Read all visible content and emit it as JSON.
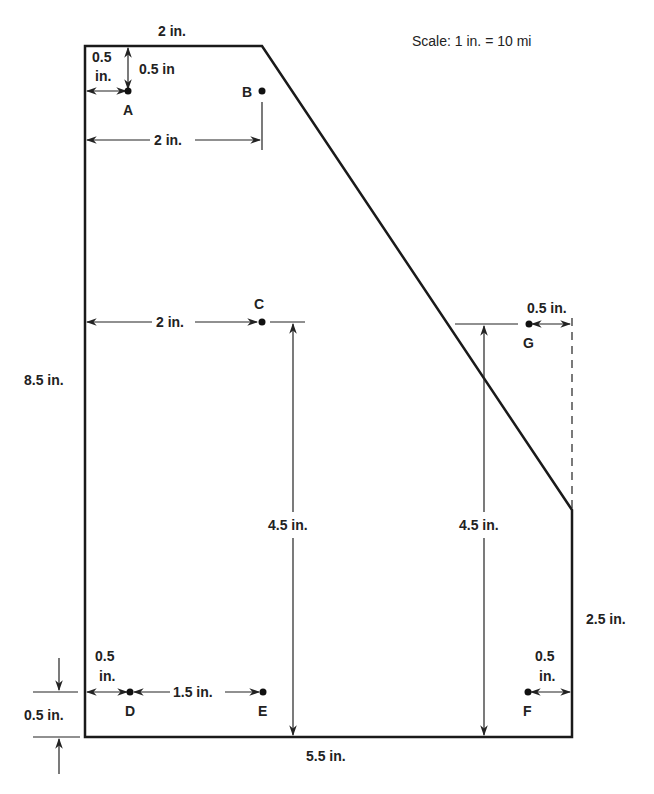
{
  "diagram": {
    "type": "dimensioned-map",
    "scale_label": "Scale:  1 in. = 10 mi",
    "colors": {
      "line": "#1a1a1a",
      "background": "#ffffff"
    },
    "dimensions": {
      "top_width": "2 in.",
      "left_height": "8.5 in.",
      "bottom_width": "5.5 in.",
      "right_height": "2.5 in.",
      "a_from_left": "0.5",
      "a_from_left_unit": "in.",
      "a_from_top": "0.5 in",
      "b_from_left": "2 in.",
      "c_from_left": "2 in.",
      "c_height": "4.5 in.",
      "g_height": "4.5 in.",
      "g_from_right": "0.5 in.",
      "d_from_left": "0.5",
      "d_from_left_unit": "in.",
      "d_to_e": "1.5 in.",
      "d_from_bottom": "0.5 in.",
      "f_from_right": "0.5",
      "f_from_right_unit": "in."
    },
    "points": [
      {
        "id": "A",
        "label": "A"
      },
      {
        "id": "B",
        "label": "B"
      },
      {
        "id": "C",
        "label": "C"
      },
      {
        "id": "D",
        "label": "D"
      },
      {
        "id": "E",
        "label": "E"
      },
      {
        "id": "F",
        "label": "F"
      },
      {
        "id": "G",
        "label": "G"
      }
    ]
  }
}
